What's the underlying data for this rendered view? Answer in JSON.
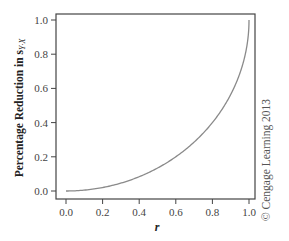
{
  "chart_data": {
    "type": "line",
    "title": "",
    "xlabel": "r",
    "ylabel": "Percentage Reduction in s",
    "ylabel_subscript": "Y·X",
    "xlim": [
      0.0,
      1.0
    ],
    "ylim": [
      0.0,
      1.0
    ],
    "x_ticks": [
      "0.0",
      "0.2",
      "0.4",
      "0.6",
      "0.8",
      "1.0"
    ],
    "y_ticks": [
      "0.0",
      "0.2",
      "0.4",
      "0.6",
      "0.8",
      "1.0"
    ],
    "grid": false,
    "legend": null,
    "series": [
      {
        "name": "Percentage reduction in s_Y·X vs r",
        "function": "1 - sqrt(1 - r^2)",
        "x": [
          0.0,
          0.1,
          0.2,
          0.3,
          0.4,
          0.5,
          0.6,
          0.7,
          0.8,
          0.9,
          0.95,
          0.99,
          1.0
        ],
        "y": [
          0.0,
          0.005,
          0.02,
          0.046,
          0.083,
          0.134,
          0.2,
          0.286,
          0.4,
          0.564,
          0.688,
          0.859,
          1.0
        ]
      }
    ],
    "colors": {
      "curve": "#8a8a8a",
      "frame": "#444444",
      "text": "#333333"
    },
    "annotation": "© Cengage Learning 2013"
  }
}
